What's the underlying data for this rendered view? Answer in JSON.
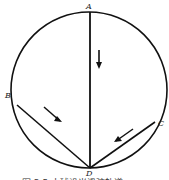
{
  "diagram": {
    "points": {
      "A": {
        "label": "A"
      },
      "B": {
        "label": "B"
      },
      "C": {
        "label": "C"
      },
      "D": {
        "label": "D"
      }
    },
    "chords": [
      "AD",
      "BD",
      "CD"
    ],
    "arrows": [
      "down along AD",
      "toward D along BD",
      "toward D along CD"
    ],
    "caption": "图 3.5  小球沿光滑弦轨道"
  }
}
